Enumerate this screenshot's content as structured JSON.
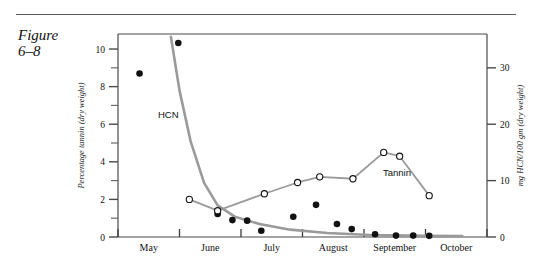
{
  "figure": {
    "caption_line1": "Figure",
    "caption_line2": "6–8"
  },
  "chart_data": {
    "type": "line",
    "title": "",
    "xlabel": "",
    "ylabel": "Percentage tannin (dry weight)",
    "y2label": "mg HCN/100 gm (dry weight)",
    "grid": false,
    "legend": "inline-annotations",
    "xlim": [
      0,
      6
    ],
    "ylim": [
      0,
      10.8
    ],
    "y2lim": [
      0,
      36
    ],
    "x_tick_labels": [
      "May",
      "June",
      "July",
      "August",
      "September",
      "October"
    ],
    "y_tick_labels": [
      "0",
      "2",
      "4",
      "6",
      "8",
      "10"
    ],
    "y_tick_values": [
      0,
      2,
      4,
      6,
      8,
      10
    ],
    "y_minor_values": [
      1,
      3,
      5,
      7,
      9
    ],
    "y2_tick_labels": [
      "0",
      "10",
      "20",
      "30"
    ],
    "y2_tick_values": [
      0,
      10,
      20,
      30
    ],
    "series": [
      {
        "name": "HCN",
        "label": "HCN",
        "axis": "right",
        "marker": "filled-circle",
        "color": "#111111",
        "line_color": "#9a9a9a",
        "points": [
          {
            "x": 0.35,
            "y": 29.0
          },
          {
            "x": 0.98,
            "y": 34.4
          },
          {
            "x": 1.62,
            "y": 4.1
          },
          {
            "x": 1.86,
            "y": 3.0
          },
          {
            "x": 2.1,
            "y": 2.9
          },
          {
            "x": 2.33,
            "y": 1.1
          },
          {
            "x": 2.85,
            "y": 3.6
          },
          {
            "x": 3.22,
            "y": 5.7
          },
          {
            "x": 3.56,
            "y": 2.3
          },
          {
            "x": 3.8,
            "y": 1.4
          },
          {
            "x": 4.18,
            "y": 0.5
          },
          {
            "x": 4.52,
            "y": 0.25
          },
          {
            "x": 4.8,
            "y": 0.25
          },
          {
            "x": 5.06,
            "y": 0.2
          }
        ],
        "curve": [
          {
            "x": 0.86,
            "y": 35.5
          },
          {
            "x": 1.0,
            "y": 26.0
          },
          {
            "x": 1.18,
            "y": 17.0
          },
          {
            "x": 1.4,
            "y": 9.6
          },
          {
            "x": 1.62,
            "y": 5.6
          },
          {
            "x": 1.9,
            "y": 3.6
          },
          {
            "x": 2.3,
            "y": 2.3
          },
          {
            "x": 2.8,
            "y": 1.3
          },
          {
            "x": 3.4,
            "y": 0.7
          },
          {
            "x": 4.1,
            "y": 0.35
          },
          {
            "x": 5.0,
            "y": 0.2
          },
          {
            "x": 5.6,
            "y": 0.15
          }
        ]
      },
      {
        "name": "Tannin",
        "label": "Tannin",
        "axis": "left",
        "marker": "open-circle",
        "color": "#111111",
        "line_color": "#9a9a9a",
        "points": [
          {
            "x": 1.16,
            "y": 2.0
          },
          {
            "x": 1.62,
            "y": 1.4
          },
          {
            "x": 2.38,
            "y": 2.3
          },
          {
            "x": 2.92,
            "y": 2.9
          },
          {
            "x": 3.28,
            "y": 3.2
          },
          {
            "x": 3.82,
            "y": 3.1
          },
          {
            "x": 4.32,
            "y": 4.5
          },
          {
            "x": 4.58,
            "y": 4.3
          },
          {
            "x": 5.06,
            "y": 2.2
          }
        ]
      }
    ],
    "annotations": [
      {
        "text": "HCN",
        "x_px": 158,
        "y_px": 118
      },
      {
        "text": "Tannin",
        "x_px": 383,
        "y_px": 176
      }
    ]
  }
}
